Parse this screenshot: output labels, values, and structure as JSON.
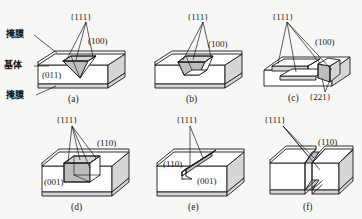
{
  "figure": {
    "type": "technical-diagram",
    "background_color": "#f7f7f5",
    "line_color": "#1a1a1a",
    "face_fill": "#ffffff",
    "shade_fill": "#d9d9d9"
  },
  "annotations": {
    "mask_top": "掩膜",
    "substrate": "基体",
    "mask_bottom": "掩膜"
  },
  "panels": [
    {
      "id": "a",
      "caption": "(a)",
      "surface_plane": "(100)",
      "side_plane": "(011)",
      "sidewall_plane": "{111}",
      "feature": "v-groove-pyramidal-pit"
    },
    {
      "id": "b",
      "caption": "(b)",
      "surface_plane": "(100)",
      "sidewall_plane": "{111}",
      "feature": "truncated-pyramid-pit"
    },
    {
      "id": "c",
      "caption": "(c)",
      "surface_plane": "(100)",
      "sidewall_plane": "{111}",
      "extra_plane": "{221}",
      "feature": "undercut-stepped-mesa"
    },
    {
      "id": "d",
      "caption": "(d)",
      "surface_plane": "(001)",
      "side_plane": "(110)",
      "sidewall_plane": "{111}",
      "feature": "vertical-walled-pit"
    },
    {
      "id": "e",
      "caption": "(e)",
      "surface_plane": "(001)",
      "side_plane": "(110)",
      "sidewall_plane": "{111}",
      "feature": "narrow-diagonal-slot"
    },
    {
      "id": "f",
      "caption": "(f)",
      "side_plane": "(110)",
      "sidewall_plane": "{111}",
      "feature": "through-v-groove-separation"
    }
  ]
}
